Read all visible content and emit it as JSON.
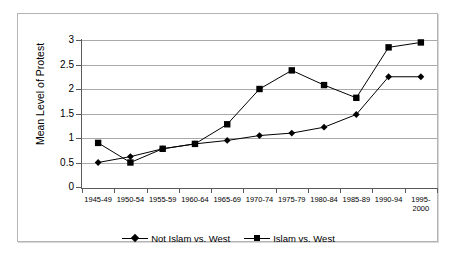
{
  "chart_data": {
    "type": "line",
    "title": "",
    "xlabel": "",
    "ylabel": "Mean Level of Protest",
    "ylim": [
      0,
      3
    ],
    "ytick_values": [
      0,
      0.5,
      1,
      1.5,
      2,
      2.5,
      3
    ],
    "ytick_labels": [
      "0",
      "0.5",
      "1",
      "1.5",
      "2",
      "2.5",
      "3"
    ],
    "grid": true,
    "legend_position": "bottom",
    "categories": [
      "1945-49",
      "1950-54",
      "1955-59",
      "1960-64",
      "1965-69",
      "1970-74",
      "1975-79",
      "1980-84",
      "1985-89",
      "1990-94",
      "1995-\n2000"
    ],
    "series": [
      {
        "name": "Not Islam vs. West",
        "marker": "diamond",
        "values": [
          0.5,
          0.62,
          0.78,
          0.88,
          0.95,
          1.05,
          1.1,
          1.22,
          1.48,
          2.25,
          2.25
        ]
      },
      {
        "name": "Islam vs. West",
        "marker": "square",
        "values": [
          0.9,
          0.5,
          0.78,
          0.88,
          1.28,
          2.0,
          2.38,
          2.08,
          1.82,
          2.85,
          2.95
        ]
      }
    ]
  },
  "legend": {
    "items": [
      {
        "label": "Not Islam vs. West",
        "marker": "diamond"
      },
      {
        "label": "Islam vs. West",
        "marker": "square"
      }
    ]
  },
  "colors": {
    "series_line": "#000000",
    "gridline": "#a9a9a9",
    "axis": "#5a5a5a",
    "frame_border": "#b4b4b4",
    "background": "#ffffff",
    "text": "#000000"
  }
}
